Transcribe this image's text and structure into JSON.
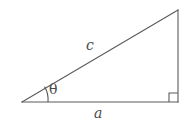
{
  "figure": {
    "type": "right-triangle-diagram",
    "background_color": "#ffffff",
    "stroke_color": "#5a5a5a",
    "label_color": "#4a4a4a",
    "stroke_width": 1.1,
    "labels": {
      "hypotenuse": "c",
      "base": "a",
      "angle": "θ"
    },
    "vertices": {
      "left": {
        "x": 22,
        "y": 102
      },
      "bottom_right": {
        "x": 178,
        "y": 102
      },
      "top_right": {
        "x": 178,
        "y": 10
      }
    },
    "markers": {
      "angle_arc": {
        "name": "theta-arc",
        "center_x": 22,
        "center_y": 102,
        "radius": 26
      },
      "right_angle_square": {
        "name": "right-angle-marker",
        "x": 168,
        "y": 92,
        "size": 9
      }
    }
  }
}
